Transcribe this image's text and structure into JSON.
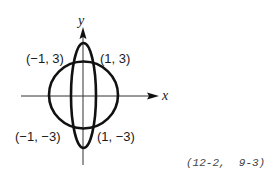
{
  "diagram": {
    "axes": {
      "x_label": "x",
      "y_label": "y"
    },
    "curves": [
      {
        "name": "circle",
        "description": "circle centered at origin"
      },
      {
        "name": "ellipse",
        "description": "tall ellipse centered at origin"
      }
    ],
    "intersection_points": [
      {
        "label": "(−1, 3)"
      },
      {
        "label": "(1, 3)"
      },
      {
        "label": "(−1, −3)"
      },
      {
        "label": "(1, −3)"
      }
    ],
    "reference": "(12-2,  9-3)"
  }
}
